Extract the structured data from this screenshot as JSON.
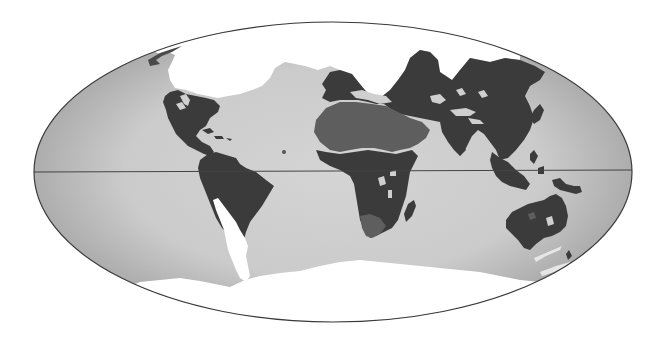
{
  "map": {
    "projection": "elliptical (Mollweide-like) world map",
    "style": "grayscale",
    "colors": {
      "background": "#ffffff",
      "ocean_edge": "#b3b3b3",
      "ocean_center": "#d2d2d2",
      "ice": "#ffffff",
      "land_dark": "#3b3b3b",
      "land_medium": "#5e5e5e",
      "outline": "#3a3a3a"
    },
    "ellipse": {
      "cx": 333,
      "cy": 172,
      "rx": 299,
      "ry": 150
    },
    "equator_y": 172,
    "regions": [
      {
        "id": "arctic-ice",
        "label": "Arctic ice / polar region",
        "shade": "ice"
      },
      {
        "id": "antarctic-ice",
        "label": "Antarctic ice / polar region",
        "shade": "ice"
      },
      {
        "id": "north-america",
        "label": "North America",
        "shade": "land_dark"
      },
      {
        "id": "south-america",
        "label": "South America",
        "shade": "land_dark"
      },
      {
        "id": "patagonia",
        "label": "Southern South America",
        "shade": "ice"
      },
      {
        "id": "europe-asia",
        "label": "Eurasia",
        "shade": "land_dark"
      },
      {
        "id": "africa",
        "label": "Africa",
        "shade": "land_dark"
      },
      {
        "id": "sahara-arabia",
        "label": "Sahara / Arabia",
        "shade": "land_medium"
      },
      {
        "id": "madagascar",
        "label": "Madagascar",
        "shade": "land_dark"
      },
      {
        "id": "southeast-asia",
        "label": "Southeast Asia / Indonesia",
        "shade": "land_dark"
      },
      {
        "id": "new-guinea",
        "label": "New Guinea",
        "shade": "land_dark"
      },
      {
        "id": "australia",
        "label": "Australia",
        "shade": "land_dark"
      },
      {
        "id": "new-zealand",
        "label": "New Zealand",
        "shade": "land_dark"
      }
    ]
  }
}
